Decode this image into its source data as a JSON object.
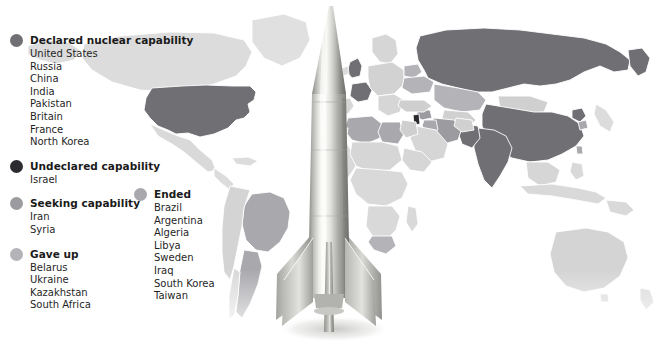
{
  "top_caption": "Nuclear states worldwide",
  "colors": {
    "declared": "#6f6f74",
    "undeclared": "#2c2c30",
    "seeking": "#9b9ba0",
    "gave_up": "#b4b4b8",
    "ended": "#a8a8ad",
    "map_background": "#ffffff",
    "map_neutral": "#d9d9d9",
    "map_neutral_light": "#e4e4e4",
    "map_border": "#ffffff",
    "text": "#1a1a1a",
    "rocket_body_light": "#f2f2f0",
    "rocket_body_mid": "#c9c9c5",
    "rocket_body_dark": "#8f8f8c"
  },
  "legend": {
    "primary": [
      {
        "id": "declared",
        "title": "Declared nuclear capability",
        "swatch": "#6f6f74",
        "countries": [
          "United States",
          "Russia",
          "China",
          "India",
          "Pakistan",
          "Britain",
          "France",
          "North Korea"
        ]
      },
      {
        "id": "undeclared",
        "title": "Undeclared capability",
        "swatch": "#2c2c30",
        "countries": [
          "Israel"
        ]
      },
      {
        "id": "seeking",
        "title": "Seeking capability",
        "swatch": "#9b9ba0",
        "countries": [
          "Iran",
          "Syria"
        ]
      },
      {
        "id": "gave-up",
        "title": "Gave up",
        "swatch": "#b4b4b8",
        "countries": [
          "Belarus",
          "Ukraine",
          "Kazakhstan",
          "South Africa"
        ]
      }
    ],
    "secondary": [
      {
        "id": "ended",
        "title": "Ended",
        "swatch": "#a8a8ad",
        "countries": [
          "Brazil",
          "Argentina",
          "Algeria",
          "Libya",
          "Sweden",
          "Iraq",
          "South Korea",
          "Taiwan"
        ]
      }
    ]
  },
  "illustration": {
    "rocket_label": "ballistic-missile-photo"
  }
}
